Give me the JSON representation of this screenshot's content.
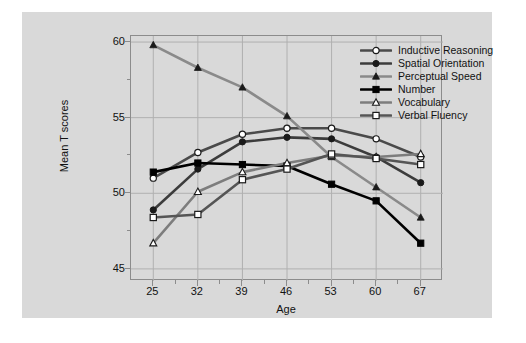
{
  "chart_data": {
    "type": "line",
    "title": "",
    "xlabel": "Age",
    "ylabel": "Mean T scores",
    "x": [
      25,
      32,
      39,
      46,
      53,
      60,
      67
    ],
    "xtick_labels": [
      "25",
      "32",
      "39",
      "46",
      "53",
      "60",
      "67"
    ],
    "ytick_labels": [
      "45",
      "50",
      "55",
      "60"
    ],
    "yticks": [
      45,
      50,
      55,
      60
    ],
    "ylim": [
      44.2,
      60.4
    ],
    "xlim": [
      21.5,
      70.5
    ],
    "grid": true,
    "legend_position": "top-right-inside",
    "series": [
      {
        "name": "Inductive Reasoning",
        "marker": "open-circle",
        "color": "#4a4a4a",
        "values": [
          51.0,
          52.7,
          53.9,
          54.3,
          54.3,
          53.6,
          52.4
        ]
      },
      {
        "name": "Spatial Orientation",
        "marker": "filled-circle",
        "color": "#3c3c3c",
        "values": [
          48.9,
          51.6,
          53.4,
          53.7,
          53.6,
          52.4,
          50.7
        ]
      },
      {
        "name": "Perceptual Speed",
        "marker": "filled-triangle",
        "color": "#8a8a8a",
        "values": [
          59.8,
          58.3,
          57.0,
          55.1,
          52.4,
          50.4,
          48.4
        ]
      },
      {
        "name": "Number",
        "marker": "filled-square",
        "color": "#000000",
        "values": [
          51.4,
          52.0,
          51.9,
          51.8,
          50.6,
          49.5,
          46.7
        ]
      },
      {
        "name": "Vocabulary",
        "marker": "open-triangle",
        "color": "#7d7d7d",
        "values": [
          46.7,
          50.1,
          51.4,
          52.0,
          52.5,
          52.4,
          52.6
        ]
      },
      {
        "name": "Verbal Fluency",
        "marker": "open-square",
        "color": "#555555",
        "values": [
          48.4,
          48.6,
          50.9,
          51.6,
          52.6,
          52.3,
          51.9
        ]
      }
    ]
  },
  "legend": {
    "items": [
      {
        "label": "Inductive Reasoning"
      },
      {
        "label": "Spatial Orientation"
      },
      {
        "label": "Perceptual Speed"
      },
      {
        "label": "Number"
      },
      {
        "label": "Vocabulary"
      },
      {
        "label": "Verbal Fluency"
      }
    ]
  },
  "colors": {
    "figure_background": "#d9d9d9",
    "page_background": "#ffffff",
    "axis": "#8c8c8c",
    "gridline": "#b0b0b0",
    "text": "#111111"
  }
}
